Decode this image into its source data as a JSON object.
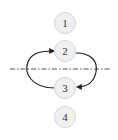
{
  "diagram": {
    "nodes": [
      {
        "id": "1",
        "label": "1",
        "cx": 65,
        "cy": 23
      },
      {
        "id": "2",
        "label": "2",
        "cx": 65,
        "cy": 51
      },
      {
        "id": "3",
        "label": "3",
        "cx": 65,
        "cy": 88
      },
      {
        "id": "4",
        "label": "4",
        "cx": 65,
        "cy": 117
      }
    ],
    "edges": [
      {
        "from": "3",
        "to": "2",
        "side": "left"
      },
      {
        "from": "2",
        "to": "3",
        "side": "right"
      }
    ],
    "axis_line": {
      "style": "dash-dot",
      "y": 69
    }
  },
  "colors": {
    "node_fill": "#f0f0f0",
    "node_stroke": "#d6d6d6",
    "edge": "#222222",
    "axis": "#555555"
  }
}
